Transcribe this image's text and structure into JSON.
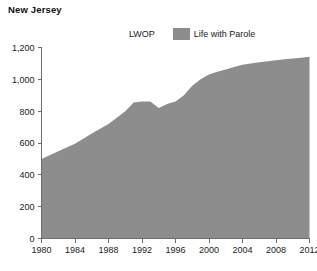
{
  "chart_title": "New Jersey",
  "legend": {
    "entries": [
      {
        "label": "LWOP",
        "swatch": "none",
        "color": "#ffffff"
      },
      {
        "label": "Life with Parole",
        "swatch": "filled",
        "color": "#8d8d8d"
      }
    ]
  },
  "chart_data": {
    "type": "area",
    "title": "New Jersey",
    "xlabel": "",
    "ylabel": "",
    "xlim": [
      1980,
      2012
    ],
    "ylim": [
      0,
      1200
    ],
    "grid": false,
    "legend_position": "top-center",
    "x_ticks": [
      "1980",
      "1984",
      "1988",
      "1992",
      "1996",
      "2000",
      "2004",
      "2008",
      "2012"
    ],
    "y_ticks": [
      "0",
      "200",
      "400",
      "600",
      "800",
      "1,000",
      "1,200"
    ],
    "series": [
      {
        "name": "Life with Parole",
        "color": "#8d8d8d",
        "x": [
          1980,
          1982,
          1984,
          1986,
          1988,
          1990,
          1991,
          1992,
          1993,
          1994,
          1995,
          1996,
          1997,
          1998,
          1999,
          2000,
          2001,
          2002,
          2003,
          2004,
          2005,
          2006,
          2007,
          2008,
          2009,
          2010,
          2011,
          2012
        ],
        "values": [
          500,
          548,
          595,
          660,
          720,
          800,
          855,
          860,
          860,
          820,
          845,
          860,
          900,
          960,
          1000,
          1030,
          1048,
          1062,
          1078,
          1092,
          1100,
          1108,
          1114,
          1120,
          1126,
          1131,
          1136,
          1142
        ]
      },
      {
        "name": "LWOP",
        "color": "#ffffff",
        "x": [
          1980,
          2012
        ],
        "values": [
          0,
          0
        ]
      }
    ]
  }
}
